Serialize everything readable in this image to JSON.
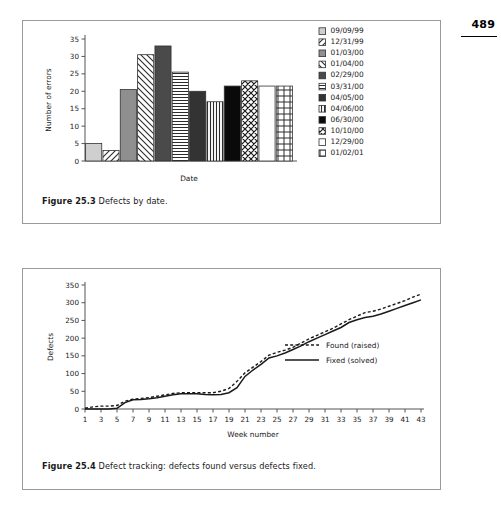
{
  "page": {
    "number": "489",
    "running_head": "How we have implemented automated testing using RadSTAR"
  },
  "figure1": {
    "caption_number": "Figure 25.3",
    "caption_text": "Defects by date."
  },
  "figure2": {
    "caption_number": "Figure 25.4",
    "caption_text": "Defect tracking: defects found versus defects fixed."
  },
  "chart_data": [
    {
      "type": "bar",
      "title": "",
      "xlabel": "Date",
      "ylabel": "Number of errors",
      "ylim": [
        0,
        35
      ],
      "yticks": [
        0,
        5,
        10,
        15,
        20,
        25,
        30,
        35
      ],
      "grid": false,
      "legend_position": "right",
      "categories": [
        "09/09/99",
        "12/31/99",
        "01/03/00",
        "01/04/00",
        "02/29/00",
        "03/31/00",
        "04/05/00",
        "04/06/00",
        "06/30/00",
        "10/10/00",
        "12/29/00",
        "01/02/01"
      ],
      "values": [
        5,
        3,
        20.5,
        30.5,
        33,
        25.5,
        20,
        17,
        21.5,
        23,
        21.5,
        21.5
      ],
      "patterns": [
        "solid-light-gray",
        "diagonal-hatch-left",
        "solid-gray",
        "diagonal-hatch-right",
        "solid-dark-gray",
        "horizontal-lines",
        "solid-dark",
        "vertical-lines",
        "solid-black",
        "cross-diagonal",
        "solid-white",
        "grid-lines"
      ]
    },
    {
      "type": "line",
      "title": "",
      "xlabel": "Week number",
      "ylabel": "Defects",
      "ylim": [
        0,
        350
      ],
      "yticks": [
        0,
        50,
        100,
        150,
        200,
        250,
        300,
        350
      ],
      "xlim": [
        1,
        43
      ],
      "xticks": [
        1,
        3,
        5,
        7,
        9,
        11,
        13,
        15,
        17,
        19,
        21,
        23,
        25,
        27,
        29,
        31,
        33,
        35,
        37,
        39,
        41,
        43
      ],
      "grid": false,
      "legend_position": "inside-right",
      "x": [
        1,
        2,
        3,
        4,
        5,
        6,
        7,
        8,
        9,
        10,
        11,
        12,
        13,
        14,
        15,
        16,
        17,
        18,
        19,
        20,
        21,
        22,
        23,
        24,
        25,
        26,
        27,
        28,
        29,
        30,
        31,
        32,
        33,
        34,
        35,
        36,
        37,
        38,
        39,
        40,
        41,
        42,
        43
      ],
      "series": [
        {
          "name": "Found (raised)",
          "style": "dotted",
          "values": [
            2,
            6,
            8,
            8,
            10,
            22,
            28,
            30,
            32,
            36,
            40,
            44,
            46,
            46,
            46,
            46,
            46,
            50,
            58,
            78,
            102,
            118,
            134,
            152,
            160,
            166,
            174,
            186,
            198,
            208,
            218,
            228,
            240,
            252,
            262,
            272,
            276,
            282,
            290,
            298,
            306,
            316,
            324
          ]
        },
        {
          "name": "Fixed (solved)",
          "style": "solid",
          "values": [
            0,
            0,
            0,
            0,
            2,
            18,
            26,
            27,
            29,
            32,
            36,
            40,
            43,
            43,
            43,
            41,
            40,
            41,
            46,
            60,
            92,
            110,
            126,
            144,
            150,
            158,
            168,
            178,
            190,
            200,
            210,
            220,
            230,
            244,
            252,
            258,
            262,
            268,
            276,
            284,
            292,
            300,
            308
          ]
        }
      ]
    }
  ]
}
